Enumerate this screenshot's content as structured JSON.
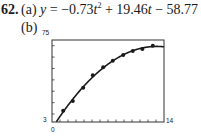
{
  "problem": {
    "number": "62.",
    "part_a_label": "(a)",
    "equation": {
      "lhs": "y",
      "eq": " = ",
      "term1": "−0.73",
      "var1": "t",
      "exp1": "2",
      "term2": " + 19.46",
      "var2": "t",
      "term3": " − 58.77"
    },
    "part_b_label": "(b)"
  },
  "chart_data": {
    "type": "scatter",
    "title": "",
    "xlabel": "",
    "ylabel": "",
    "xlim": [
      0,
      14
    ],
    "ylim": [
      3,
      75
    ],
    "x_tick_labels": [
      "0",
      "14"
    ],
    "y_tick_labels": [
      "3",
      "75"
    ],
    "x_tick_step": 1,
    "y_tick_step": 10,
    "grid": false,
    "legend": null,
    "series": [
      {
        "name": "data points",
        "type": "scatter",
        "x": [
          1.4,
          2.6,
          3.9,
          5.1,
          6.4,
          7.6,
          8.9,
          10.1,
          11.3,
          12.6
        ],
        "y": [
          12.9,
          21.4,
          33.1,
          44.0,
          51.0,
          56.8,
          61.8,
          65.3,
          67.1,
          70.0
        ]
      },
      {
        "name": "quadratic fit",
        "type": "line",
        "equation": "y = -0.73t^2 + 19.46t - 58.77"
      }
    ],
    "colors": {
      "points": "#1a1a1a",
      "curve": "#1a1a1a",
      "frame": "#333333"
    }
  }
}
